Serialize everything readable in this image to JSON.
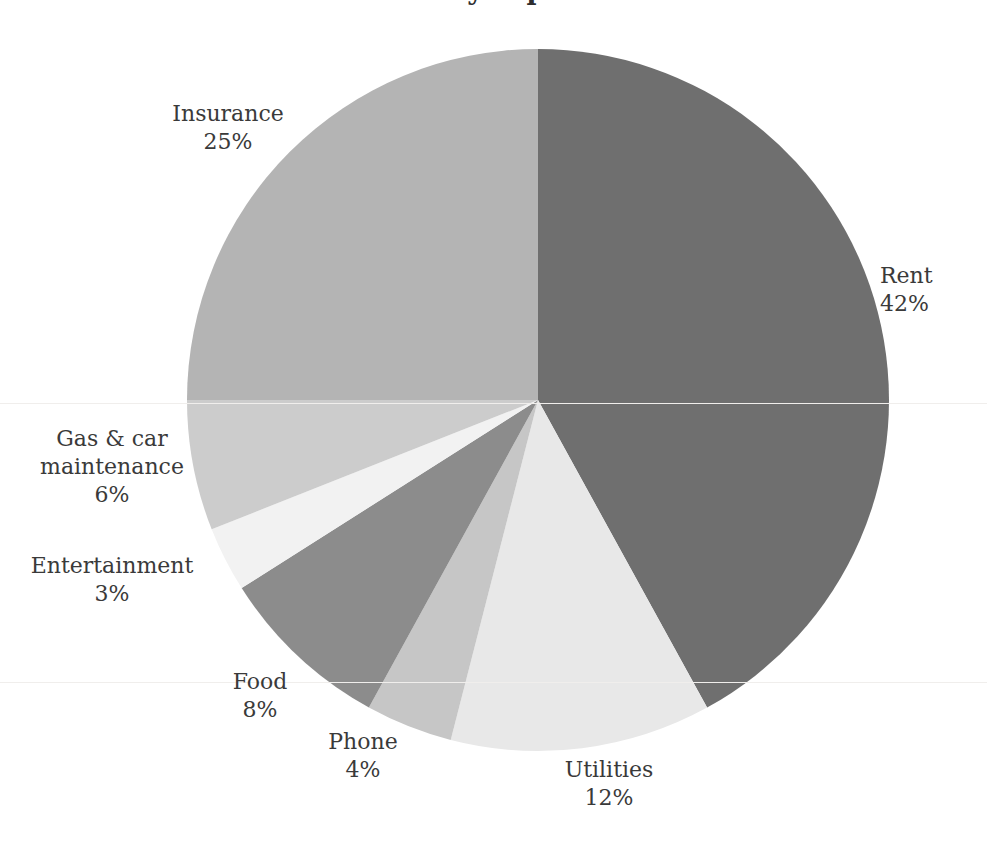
{
  "chart_data": {
    "type": "pie",
    "title": "Monthly expenses",
    "xlabel": "",
    "ylabel": "",
    "legend": "none",
    "grid": false,
    "value_unit": "%",
    "start_angle_deg": 0,
    "direction": "clockwise",
    "categories": [
      "Rent",
      "Utilities",
      "Phone",
      "Food",
      "Entertainment",
      "Gas & car maintenance",
      "Insurance"
    ],
    "values": [
      42,
      12,
      4,
      8,
      3,
      6,
      25
    ],
    "value_labels": [
      "42%",
      "12%",
      "4%",
      "8%",
      "3%",
      "6%",
      "25%"
    ],
    "colors": [
      "#6f6f6f",
      "#e8e8e8",
      "#c6c6c6",
      "#8c8c8c",
      "#f2f2f2",
      "#cccccc",
      "#b4b4b4"
    ],
    "slices": [
      {
        "name": "Rent",
        "value": 42,
        "label_value": "42%",
        "color": "#6f6f6f"
      },
      {
        "name": "Utilities",
        "value": 12,
        "label_value": "12%",
        "color": "#e8e8e8"
      },
      {
        "name": "Phone",
        "value": 4,
        "label_value": "4%",
        "color": "#c6c6c6"
      },
      {
        "name": "Food",
        "value": 8,
        "label_value": "8%",
        "color": "#8c8c8c"
      },
      {
        "name": "Entertainment",
        "value": 3,
        "label_value": "3%",
        "color": "#f2f2f2"
      },
      {
        "name": "Gas & car maintenance",
        "value": 6,
        "label_value": "6%",
        "color": "#cccccc"
      },
      {
        "name": "Insurance",
        "value": 25,
        "label_value": "25%",
        "color": "#b4b4b4"
      }
    ]
  },
  "labels": {
    "insurance": {
      "name": "Insurance",
      "value": "25%"
    },
    "rent": {
      "name": "Rent",
      "value": "42%"
    },
    "gas": {
      "name_line1": "Gas & car",
      "name_line2": "maintenance",
      "value": "6%"
    },
    "entertainment": {
      "name": "Entertainment",
      "value": "3%"
    },
    "food": {
      "name": "Food",
      "value": "8%"
    },
    "phone": {
      "name": "Phone",
      "value": "4%"
    },
    "utilities": {
      "name": "Utilities",
      "value": "12%"
    }
  },
  "geometry": {
    "center_x": 538,
    "center_y": 400,
    "radius": 351
  },
  "theme": {
    "background": "#ffffff",
    "text_color": "#3a3a3a"
  }
}
